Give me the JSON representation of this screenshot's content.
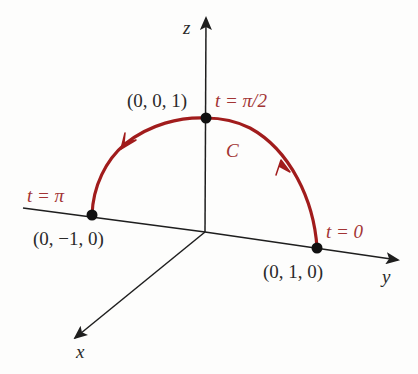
{
  "diagram": {
    "type": "3d-parametric-curve",
    "colors": {
      "axis": "#1e1e1e",
      "curve": "#a11c1c",
      "point": "#111111",
      "point_label": "#2a2a2a",
      "param_label": "#a23434",
      "background": "#fdfdfc"
    },
    "axes": {
      "x": {
        "label": "x"
      },
      "y": {
        "label": "y"
      },
      "z": {
        "label": "z"
      }
    },
    "curve": {
      "name": "C",
      "direction": "counterclockwise from (0, 1, 0) through (0, 0, 1) to (0, −1, 0)"
    },
    "points": [
      {
        "id": "start",
        "coord_label": "(0, 1, 0)",
        "param_label": "t = 0"
      },
      {
        "id": "mid",
        "coord_label": "(0, 0, 1)",
        "param_label": "t = π/2"
      },
      {
        "id": "end",
        "coord_label": "(0, −1, 0)",
        "param_label": "t = π"
      }
    ]
  }
}
